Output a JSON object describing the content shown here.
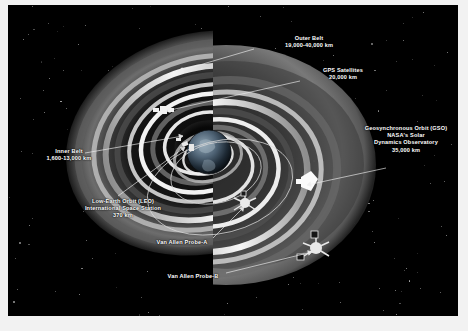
{
  "figure": {
    "background_color": "#000000",
    "label_color": "#ffffff",
    "frame_color": "#f2f2f2"
  },
  "labels": [
    {
      "id": "outer-belt",
      "lines": [
        "Outer Belt",
        "19,000-40,000 km"
      ],
      "x": 255,
      "y": 30,
      "width": 92,
      "leader": {
        "x1": 246,
        "y1": 44,
        "x2": 171,
        "y2": 66
      }
    },
    {
      "id": "gps-satellites",
      "lines": [
        "GPS Satellites",
        "20,000 km"
      ],
      "x": 295,
      "y": 62,
      "width": 80,
      "leader": {
        "x1": 292,
        "y1": 76,
        "x2": 158,
        "y2": 106
      }
    },
    {
      "id": "geosynchronous-orbit",
      "lines": [
        "Geosynchronous Orbit (GSO)",
        "NASA's Solar",
        "Dynamics Observatory",
        "35,000 km"
      ],
      "x": 337,
      "y": 120,
      "width": 122,
      "leader": {
        "x1": 378,
        "y1": 163,
        "x2": 299,
        "y2": 180
      }
    },
    {
      "id": "inner-belt",
      "lines": [
        "Inner Belt",
        "1,600-13,000 km"
      ],
      "x": 19,
      "y": 143,
      "width": 84,
      "leader": {
        "x1": 77,
        "y1": 148,
        "x2": 175,
        "y2": 131
      }
    },
    {
      "id": "low-earth-orbit",
      "lines": [
        "Low-Earth Orbit (LEO)",
        "International Space Station",
        "370 km"
      ],
      "x": 61,
      "y": 193,
      "width": 108,
      "leader": {
        "x1": 110,
        "y1": 191,
        "x2": 177,
        "y2": 142
      }
    },
    {
      "id": "van-allen-probe-a",
      "lines": [
        "Van Allen Probe-A"
      ],
      "x": 132,
      "y": 234,
      "width": 84,
      "leader": {
        "x1": 205,
        "y1": 233,
        "x2": 236,
        "y2": 202
      }
    },
    {
      "id": "van-allen-probe-b",
      "lines": [
        "Van Allen Probe-B"
      ],
      "x": 143,
      "y": 268,
      "width": 84,
      "leader": {
        "x1": 218,
        "y1": 268,
        "x2": 304,
        "y2": 247
      }
    }
  ],
  "objects": {
    "earth": "earth-globe",
    "satellites": [
      "gps-satellite",
      "space-station",
      "solar-dynamics-observatory",
      "van-allen-probe-a",
      "van-allen-probe-b"
    ]
  }
}
